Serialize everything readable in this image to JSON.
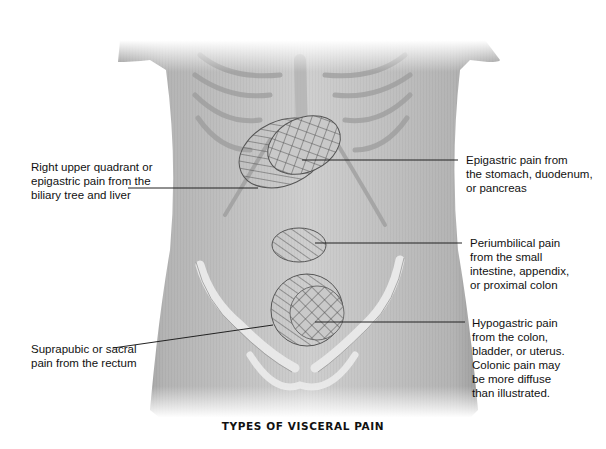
{
  "figure": {
    "title": "TYPES OF VISCERAL PAIN",
    "colors": {
      "skin": "#c8c8c8",
      "skin_dark": "#8e8e8e",
      "bone": "#e4e4e4",
      "hatch": "#444444",
      "outline": "#555555",
      "leader": "#222222"
    },
    "regions": [
      {
        "id": "right-upper-quadrant",
        "pattern": "diagonal-hatch",
        "side": "left"
      },
      {
        "id": "epigastric",
        "pattern": "crosshatch",
        "side": "right"
      },
      {
        "id": "periumbilical",
        "pattern": "diagonal-hatch",
        "side": "right"
      },
      {
        "id": "suprapubic-sacral",
        "pattern": "diagonal-hatch",
        "side": "left"
      },
      {
        "id": "hypogastric",
        "pattern": "crosshatch",
        "side": "right"
      }
    ],
    "labels": {
      "ruq": [
        "Right upper quadrant or",
        "epigastric pain from the",
        "biliary tree and liver"
      ],
      "epigastric": [
        "Epigastric pain from",
        "the stomach, duodenum,",
        "or pancreas"
      ],
      "periumbilical": [
        "Periumbilical pain",
        "from the small",
        "intestine, appendix,",
        "or proximal colon"
      ],
      "suprapubic": [
        "Suprapubic or sacral",
        "pain from the rectum"
      ],
      "hypogastric": [
        "Hypogastric pain",
        "from the colon,",
        "bladder, or uterus.",
        "Colonic pain may",
        "be more diffuse",
        "than illustrated."
      ]
    }
  }
}
